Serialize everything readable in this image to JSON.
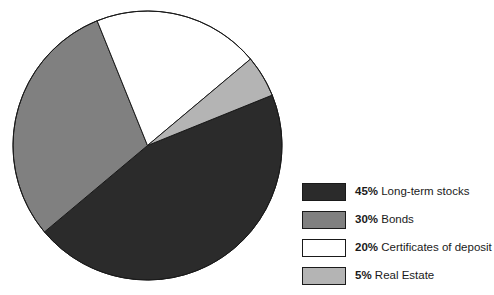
{
  "chart_data": {
    "type": "pie",
    "title": "",
    "labels": [
      "Long-term stocks",
      "Bonds",
      "Certificates of deposit",
      "Real Estate"
    ],
    "values": [
      45,
      30,
      20,
      5
    ],
    "value_suffix": "%",
    "colors": [
      "#2b2b2b",
      "#808080",
      "#ffffff",
      "#b4b4b4"
    ],
    "outline_color": "#1a1a1a",
    "start_angle_deg": -22,
    "direction": "clockwise",
    "legend_position": "right",
    "grid": false
  },
  "legend": {
    "items": [
      {
        "percent": "45%",
        "label": "Long-term stocks",
        "color": "#2b2b2b"
      },
      {
        "percent": "30%",
        "label": "Bonds",
        "color": "#808080"
      },
      {
        "percent": "20%",
        "label": "Certificates of deposit",
        "color": "#ffffff"
      },
      {
        "percent": "5%",
        "label": "Real Estate",
        "color": "#b4b4b4"
      }
    ]
  }
}
